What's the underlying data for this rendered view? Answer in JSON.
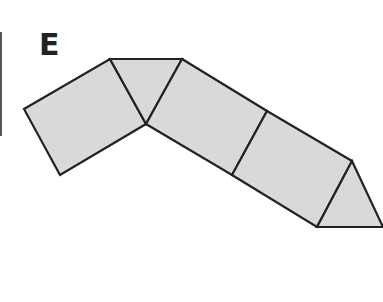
{
  "figure": {
    "label": "E",
    "fill_color": "#d9d9d9",
    "stroke_color": "#222222",
    "shapes": [
      {
        "name": "left-square",
        "points": "24,109 110,59 146,124 60,175"
      },
      {
        "name": "top-triangle",
        "points": "110,59 182,59 146,124"
      },
      {
        "name": "middle-square",
        "points": "182,59 267,111 232,175 146,124"
      },
      {
        "name": "right-square",
        "points": "267,111 352,161 317,227 232,175"
      },
      {
        "name": "end-triangle",
        "points": "352,161 383,227 317,227"
      }
    ]
  }
}
